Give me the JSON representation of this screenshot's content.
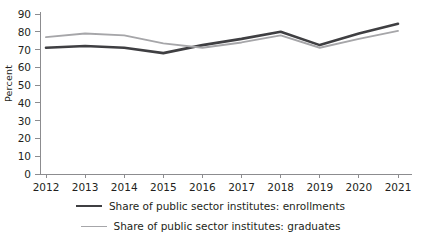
{
  "chart_data": {
    "type": "line",
    "title": "",
    "xlabel": "",
    "ylabel": "Percent",
    "x": [
      2012,
      2013,
      2014,
      2015,
      2016,
      2017,
      2018,
      2019,
      2020,
      2021
    ],
    "xtick_labels": [
      "2012",
      "2013",
      "2014",
      "2015",
      "2016",
      "2017",
      "2018",
      "2019",
      "2020",
      "2021"
    ],
    "ytick_labels": [
      "0",
      "10",
      "20",
      "30",
      "40",
      "50",
      "60",
      "70",
      "80",
      "90"
    ],
    "yticks": [
      0,
      10,
      20,
      30,
      40,
      50,
      60,
      70,
      80,
      90
    ],
    "ylim": [
      0,
      90
    ],
    "grid": false,
    "legend_position": "bottom",
    "series": [
      {
        "name": "Share of public sector institutes: enrollments",
        "color": "#3f3f42",
        "values": [
          71,
          72,
          71,
          68,
          72.5,
          76,
          80,
          72.5,
          79,
          84.5
        ]
      },
      {
        "name": "Share of public sector institutes: graduates",
        "color": "#a6a6a9",
        "values": [
          77,
          79,
          78,
          73.5,
          71,
          74,
          78,
          71,
          76,
          80.5
        ]
      }
    ]
  },
  "axis": {
    "line_color": "#8c8c8f"
  }
}
